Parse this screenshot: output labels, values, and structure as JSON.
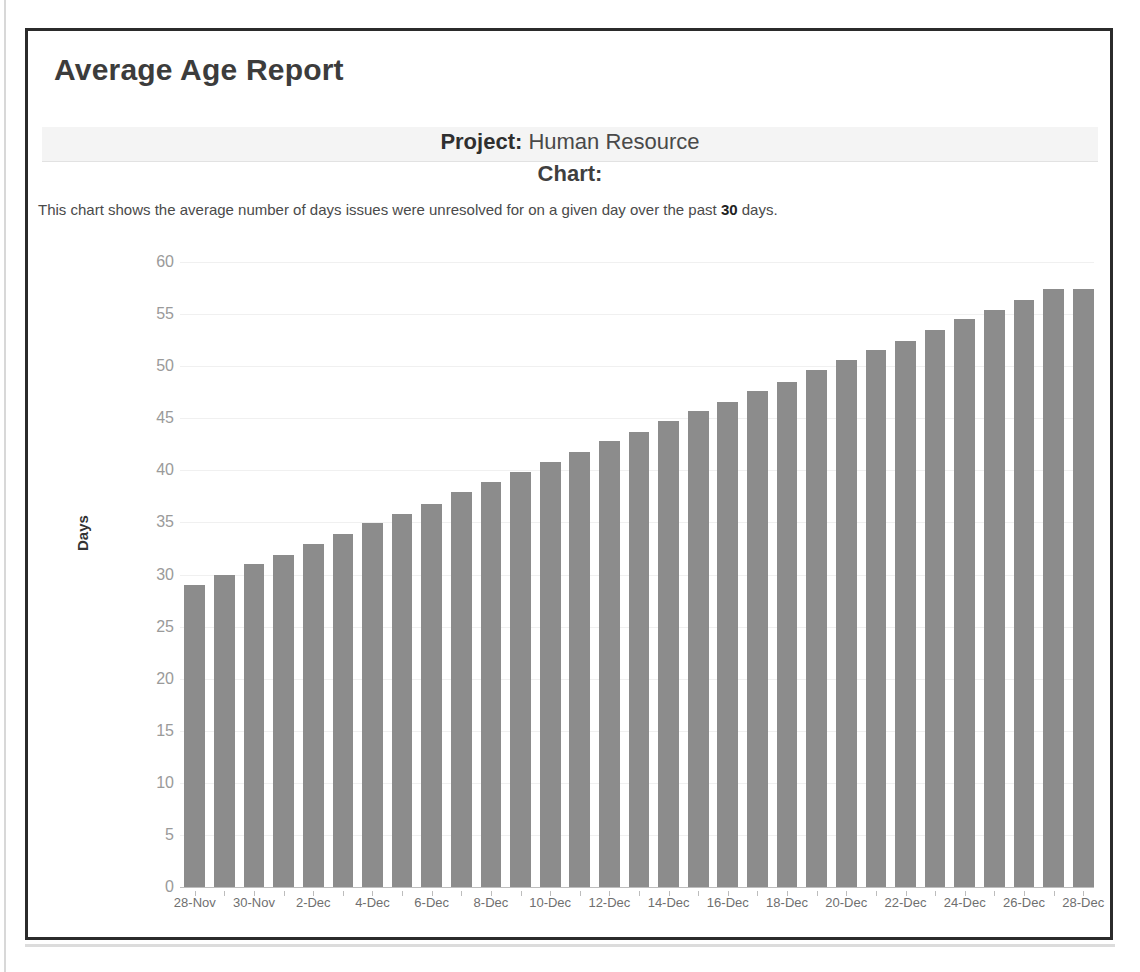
{
  "report": {
    "title": "Average Age Report",
    "project_label": "Project:",
    "project_value": "Human Resource",
    "chart_label": "Chart:",
    "description_prefix": "This chart shows the average number of days issues were unresolved for on a given day over the past ",
    "description_bold": "30",
    "description_suffix": " days."
  },
  "colors": {
    "bar": "#8c8c8c",
    "border": "#2b2b2b",
    "grid": "#f0f0f0",
    "axis": "#bdbdbd",
    "tick_text": "#9a9a9a",
    "band": "#f4f4f4"
  },
  "chart_data": {
    "type": "bar",
    "title": "Average Age Report",
    "xlabel": "",
    "ylabel": "Days",
    "ylim": [
      0,
      60
    ],
    "yticks": [
      0,
      5,
      10,
      15,
      20,
      25,
      30,
      35,
      40,
      45,
      50,
      55,
      60
    ],
    "grid": true,
    "legend": "none",
    "xtick_every": 2,
    "categories": [
      "28-Nov",
      "29-Nov",
      "30-Nov",
      "1-Dec",
      "2-Dec",
      "3-Dec",
      "4-Dec",
      "5-Dec",
      "6-Dec",
      "7-Dec",
      "8-Dec",
      "9-Dec",
      "10-Dec",
      "11-Dec",
      "12-Dec",
      "13-Dec",
      "14-Dec",
      "15-Dec",
      "16-Dec",
      "17-Dec",
      "18-Dec",
      "19-Dec",
      "20-Dec",
      "21-Dec",
      "22-Dec",
      "23-Dec",
      "24-Dec",
      "25-Dec",
      "26-Dec",
      "27-Dec",
      "28-Dec"
    ],
    "values": [
      29.0,
      30.0,
      31.0,
      31.9,
      32.9,
      33.9,
      34.9,
      35.8,
      36.8,
      37.9,
      38.9,
      39.8,
      40.8,
      41.8,
      42.8,
      43.7,
      44.7,
      45.7,
      46.6,
      47.6,
      48.5,
      49.6,
      50.6,
      51.6,
      52.4,
      53.5,
      54.5,
      55.4,
      56.4,
      57.4,
      57.4
    ]
  }
}
